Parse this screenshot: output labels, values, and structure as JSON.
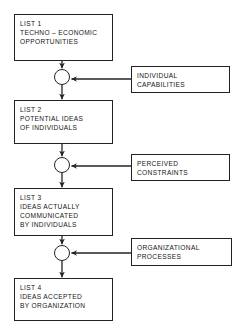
{
  "diagram": {
    "line_color": "#232323",
    "background_color": "#ffffff",
    "stages": [
      {
        "id": "list1",
        "name": "list-1-box",
        "lines": [
          "LIST 1",
          "TECHNO – ECONOMIC",
          "OPPORTUNITIES"
        ]
      },
      {
        "id": "list2",
        "name": "list-2-box",
        "lines": [
          "LIST 2",
          "POTENTIAL IDEAS",
          "OF INDIVIDUALS"
        ]
      },
      {
        "id": "list3",
        "name": "list-3-box",
        "lines": [
          "LIST 3",
          "IDEAS ACTUALLY",
          "COMMUNICATED",
          "BY INDIVIDUALS"
        ]
      },
      {
        "id": "list4",
        "name": "list-4-box",
        "lines": [
          "LIST 4",
          "IDEAS ACCEPTED",
          "BY ORGANIZATION"
        ]
      }
    ],
    "factors": [
      {
        "id": "factor1",
        "name": "individual-capabilities-box",
        "lines": [
          "INDIVIDUAL",
          "CAPABILITIES"
        ]
      },
      {
        "id": "factor2",
        "name": "perceived-constraints-box",
        "lines": [
          "PERCEIVED",
          "CONSTRAINTS"
        ]
      },
      {
        "id": "factor3",
        "name": "organizational-processes-box",
        "lines": [
          "ORGANIZATIONAL",
          "PROCESSES"
        ]
      }
    ],
    "junctions": [
      {
        "id": "junction1",
        "name": "junction-node-1"
      },
      {
        "id": "junction2",
        "name": "junction-node-2"
      },
      {
        "id": "junction3",
        "name": "junction-node-3"
      }
    ]
  }
}
